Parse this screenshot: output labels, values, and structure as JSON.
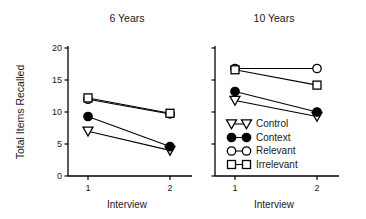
{
  "figure": {
    "ylabel": "Total Items Recalled",
    "panels": [
      {
        "title": "6 Years",
        "xlabel": "Interview",
        "xticks": [
          "1",
          "2"
        ],
        "yticks": [
          "0",
          "5",
          "10",
          "15",
          "20"
        ]
      },
      {
        "title": "10 Years",
        "xlabel": "Interview",
        "xticks": [
          "1",
          "2"
        ],
        "yticks": []
      }
    ],
    "legend": {
      "items": [
        {
          "label": "Control",
          "marker": "open-triangle-down-icon"
        },
        {
          "label": "Context",
          "marker": "filled-circle-icon"
        },
        {
          "label": "Relevant",
          "marker": "open-circle-icon"
        },
        {
          "label": "Irrelevant",
          "marker": "open-square-icon"
        }
      ]
    }
  },
  "chart_data": {
    "type": "line",
    "title": "",
    "xlabel": "Interview",
    "ylabel": "Total Items Recalled",
    "x": [
      1,
      2
    ],
    "xlim": [
      0.55,
      2.45
    ],
    "ylim": [
      0,
      20
    ],
    "yticks": [
      0,
      5,
      10,
      15,
      20
    ],
    "grid": false,
    "legend_position": "inside-lower-left-of-right-panel",
    "panels": [
      {
        "title": "6 Years",
        "series": [
          {
            "name": "Control",
            "marker": "open-triangle-down",
            "values": [
              7.0,
              4.0
            ]
          },
          {
            "name": "Context",
            "marker": "filled-circle",
            "values": [
              9.3,
              4.6
            ]
          },
          {
            "name": "Relevant",
            "marker": "open-circle",
            "values": [
              12.0,
              9.7
            ]
          },
          {
            "name": "Irrelevant",
            "marker": "open-square",
            "values": [
              12.2,
              9.8
            ]
          }
        ]
      },
      {
        "title": "10 Years",
        "series": [
          {
            "name": "Control",
            "marker": "open-triangle-down",
            "values": [
              11.8,
              9.3
            ]
          },
          {
            "name": "Context",
            "marker": "filled-circle",
            "values": [
              13.2,
              10.0
            ]
          },
          {
            "name": "Relevant",
            "marker": "open-circle",
            "values": [
              16.8,
              16.8
            ]
          },
          {
            "name": "Irrelevant",
            "marker": "open-square",
            "values": [
              16.6,
              14.2
            ]
          }
        ]
      }
    ]
  }
}
